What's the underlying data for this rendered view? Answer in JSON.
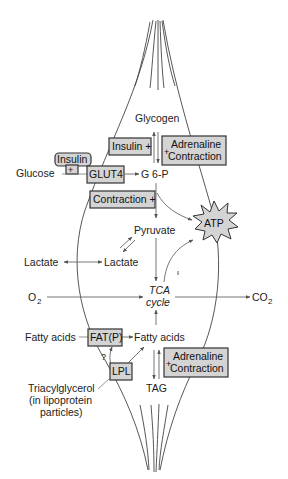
{
  "diagram": {
    "colors": {
      "box_fill": "#d4d4d4",
      "stroke": "#333333",
      "arrow": "#666666",
      "text": "#222222"
    },
    "metabolites": {
      "glycogen": "Glycogen",
      "glucose": "Glucose",
      "g6p": "G 6-P",
      "pyruvate": "Pyruvate",
      "lactate_out": "Lactate",
      "lactate_in": "Lactate",
      "o2_main": "O",
      "o2_sub": "2",
      "co2_main": "CO",
      "co2_sub": "2",
      "tca_line1": "TCA",
      "tca_line2": "cycle",
      "fatty_acids_out": "Fatty acids",
      "fatty_acids_in": "Fatty acids",
      "tag": "TAG",
      "triacylglycerol_line1": "Triacylglycerol",
      "triacylglycerol_line2": "(in lipoprotein",
      "triacylglycerol_line3": "particles)",
      "atp": "ATP",
      "question": "?"
    },
    "regulator_boxes": {
      "insulin_top": "Insulin +",
      "adrenaline_top_plus": "+",
      "adrenaline_top_line1": "Adrenaline",
      "adrenaline_top_line2": "Contraction",
      "insulin_small": "Insulin",
      "insulin_small_plus": "+",
      "glut4": "GLUT4",
      "contraction": "Contraction +",
      "fatp": "FAT(P)",
      "lpl": "LPL",
      "adrenaline_bottom_plus": "+",
      "adrenaline_bottom_line1": "Adrenaline",
      "adrenaline_bottom_line2": "Contraction"
    }
  }
}
